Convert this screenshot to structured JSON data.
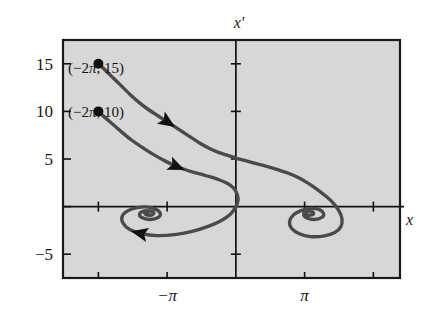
{
  "figure": {
    "kind": "phase-plane-plot",
    "background_color": "#d7d7d7",
    "frame_color": "#1a1a1a",
    "curve_color": "#4a4a4a",
    "axis_color": "#111111",
    "page_color": "#ffffff"
  },
  "axes": {
    "x_title": "x",
    "y_title": "x′",
    "x_ticks": [
      {
        "label": "",
        "value": -6.2832
      },
      {
        "label": "−π",
        "value": -3.1416
      },
      {
        "label": "",
        "value": 0
      },
      {
        "label": "π",
        "value": 3.1416
      },
      {
        "label": "",
        "value": 6.2832
      }
    ],
    "y_ticks": [
      {
        "label": "15",
        "value": 15
      },
      {
        "label": "10",
        "value": 10
      },
      {
        "label": "5",
        "value": 5
      },
      {
        "label": "",
        "value": 0
      },
      {
        "label": "−5",
        "value": -5
      }
    ],
    "xlim": [
      -7.9,
      7.5
    ],
    "ylim": [
      -7.5,
      17.5
    ]
  },
  "annotations": [
    {
      "id": "initial-point-15",
      "text_prefix": "(−2",
      "text_pi": "π",
      "text_suffix": ", 15)",
      "text": "(−2π, 15)",
      "point": [
        -6.2832,
        15
      ]
    },
    {
      "id": "initial-point-10",
      "text_prefix": "(−2",
      "text_pi": "π",
      "text_suffix": ", 10)",
      "text": "(−2π, 10)",
      "point": [
        -6.2832,
        10
      ]
    }
  ],
  "chart_data": {
    "type": "line",
    "title": "",
    "xlabel": "x",
    "ylabel": "x′",
    "xlim": [
      -7.9,
      7.5
    ],
    "ylim": [
      -7.5,
      17.5
    ],
    "grid": false,
    "legend": "none",
    "xticks": [
      -6.2832,
      -3.1416,
      0,
      3.1416,
      6.2832
    ],
    "xticklabels": [
      "",
      "−π",
      "",
      "π",
      ""
    ],
    "yticks": [
      15,
      10,
      5,
      0,
      -5
    ],
    "yticklabels": [
      "15",
      "10",
      "5",
      "",
      "−5"
    ],
    "series": [
      {
        "name": "trajectory from (−2π, 15)",
        "start_point": [
          -6.2832,
          15
        ],
        "marker": "filled-circle-at-start",
        "spiral_sink": [
          3.1416,
          0
        ],
        "arrow_at": [
          -3.05,
          9.2
        ],
        "points": [
          [
            -6.28,
            15.0
          ],
          [
            -6.0,
            14.4
          ],
          [
            -5.6,
            13.5
          ],
          [
            -5.2,
            12.6
          ],
          [
            -4.8,
            11.7
          ],
          [
            -4.4,
            10.9
          ],
          [
            -4.0,
            10.2
          ],
          [
            -3.6,
            9.6
          ],
          [
            -3.2,
            9.0
          ],
          [
            -2.8,
            8.4
          ],
          [
            -2.4,
            7.8
          ],
          [
            -2.0,
            7.2
          ],
          [
            -1.6,
            6.6
          ],
          [
            -1.2,
            6.1
          ],
          [
            -0.8,
            5.7
          ],
          [
            -0.4,
            5.4
          ],
          [
            0.0,
            5.1
          ],
          [
            0.4,
            4.85
          ],
          [
            0.8,
            4.6
          ],
          [
            1.2,
            4.35
          ],
          [
            1.6,
            4.1
          ],
          [
            2.0,
            3.8
          ],
          [
            2.4,
            3.5
          ],
          [
            2.8,
            3.1
          ],
          [
            3.2,
            2.6
          ],
          [
            3.6,
            2.0
          ],
          [
            4.0,
            1.3
          ],
          [
            4.4,
            0.5
          ],
          [
            4.7,
            -0.4
          ],
          [
            4.85,
            -1.3
          ],
          [
            4.8,
            -2.1
          ],
          [
            4.5,
            -2.75
          ],
          [
            4.0,
            -3.1
          ],
          [
            3.4,
            -3.15
          ],
          [
            2.9,
            -2.85
          ],
          [
            2.55,
            -2.3
          ],
          [
            2.45,
            -1.6
          ],
          [
            2.6,
            -0.95
          ],
          [
            2.95,
            -0.45
          ],
          [
            3.4,
            -0.2
          ],
          [
            3.8,
            -0.3
          ],
          [
            4.0,
            -0.7
          ],
          [
            3.95,
            -1.1
          ],
          [
            3.6,
            -1.35
          ],
          [
            3.25,
            -1.2
          ],
          [
            3.1,
            -0.85
          ],
          [
            3.2,
            -0.55
          ],
          [
            3.45,
            -0.5
          ],
          [
            3.55,
            -0.72
          ],
          [
            3.4,
            -0.9
          ],
          [
            3.2,
            -0.8
          ],
          [
            3.25,
            -0.62
          ]
        ]
      },
      {
        "name": "trajectory from (−2π, 10)",
        "start_point": [
          -6.2832,
          10
        ],
        "marker": "filled-circle-at-start",
        "spiral_sink": [
          -3.1416,
          0
        ],
        "arrow_at": [
          -2.75,
          4.4
        ],
        "arrow_at_2": [
          -4.05,
          -3.2
        ],
        "points": [
          [
            -6.28,
            10.0
          ],
          [
            -6.0,
            9.4
          ],
          [
            -5.6,
            8.6
          ],
          [
            -5.2,
            7.8
          ],
          [
            -4.8,
            7.05
          ],
          [
            -4.4,
            6.4
          ],
          [
            -4.0,
            5.8
          ],
          [
            -3.6,
            5.25
          ],
          [
            -3.2,
            4.75
          ],
          [
            -2.8,
            4.3
          ],
          [
            -2.4,
            3.95
          ],
          [
            -2.0,
            3.65
          ],
          [
            -1.6,
            3.4
          ],
          [
            -1.2,
            3.15
          ],
          [
            -0.8,
            2.85
          ],
          [
            -0.4,
            2.45
          ],
          [
            -0.1,
            1.95
          ],
          [
            0.05,
            1.35
          ],
          [
            0.1,
            0.7
          ],
          [
            0.0,
            0.0
          ],
          [
            -0.25,
            -0.8
          ],
          [
            -0.7,
            -1.5
          ],
          [
            -1.3,
            -2.1
          ],
          [
            -2.0,
            -2.6
          ],
          [
            -2.8,
            -2.95
          ],
          [
            -3.6,
            -3.05
          ],
          [
            -4.3,
            -2.85
          ],
          [
            -4.85,
            -2.4
          ],
          [
            -5.15,
            -1.75
          ],
          [
            -5.2,
            -1.05
          ],
          [
            -4.95,
            -0.45
          ],
          [
            -4.5,
            -0.1
          ],
          [
            -4.0,
            -0.05
          ],
          [
            -3.6,
            -0.35
          ],
          [
            -3.45,
            -0.8
          ],
          [
            -3.6,
            -1.2
          ],
          [
            -3.95,
            -1.35
          ],
          [
            -4.3,
            -1.15
          ],
          [
            -4.4,
            -0.8
          ],
          [
            -4.25,
            -0.5
          ],
          [
            -3.95,
            -0.45
          ],
          [
            -3.75,
            -0.65
          ],
          [
            -3.85,
            -0.88
          ],
          [
            -4.1,
            -0.85
          ],
          [
            -4.15,
            -0.65
          ],
          [
            -4.0,
            -0.58
          ]
        ]
      }
    ]
  }
}
